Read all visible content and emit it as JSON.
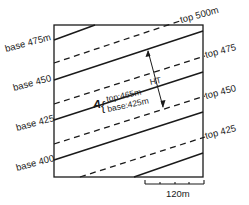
{
  "figure": {
    "type": "geological map diagram — inclined bed outcrop with structure contours",
    "frame": {
      "left": 54,
      "top": 25,
      "right": 203,
      "bottom": 177
    },
    "line_color": "#1a1a1a",
    "background": "#ffffff"
  },
  "base_contours": [
    {
      "label": "base 475m",
      "style": "solid"
    },
    {
      "label": "base 450",
      "style": "solid"
    },
    {
      "label": "base 425",
      "style": "solid"
    },
    {
      "label": "base 400",
      "style": "solid"
    }
  ],
  "top_contours": [
    {
      "label": "top 500m",
      "style": "dashed"
    },
    {
      "label": "top 475",
      "style": "dashed"
    },
    {
      "label": "top 450",
      "style": "dashed"
    },
    {
      "label": "top 425",
      "style": "dashed"
    }
  ],
  "point_a": {
    "name": "A",
    "top_label": "top:465m",
    "base_label": "base:425m"
  },
  "thickness": {
    "label": "HT"
  },
  "scale_bar": {
    "label": "120m",
    "ticks": 5
  }
}
